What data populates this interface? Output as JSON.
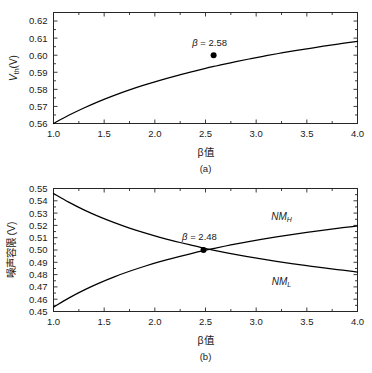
{
  "figure": {
    "background": "#ffffff",
    "line_color": "#000000",
    "axis_color": "#262626"
  },
  "panels": [
    {
      "id": "a",
      "subcaption": "(a)",
      "xlabel": "β值",
      "ylabel_main": "V",
      "ylabel_sub": "th",
      "ylabel_unit": "(V)",
      "ylabel_full": "V th (V)",
      "annotation": "β = 2.58",
      "annotation_beta": "2.58",
      "xticks": [
        "1.0",
        "1.5",
        "2.0",
        "2.5",
        "3.0",
        "3.5",
        "4.0"
      ],
      "yticks": [
        "0.56",
        "0.57",
        "0.58",
        "0.59",
        "0.60",
        "0.61",
        "0.62"
      ]
    },
    {
      "id": "b",
      "subcaption": "(b)",
      "xlabel": "β值",
      "ylabel_full": "噪声容限 (V)",
      "annotation": "β = 2.48",
      "annotation_beta": "2.48",
      "series_high_main": "NM",
      "series_high_sub": "H",
      "series_low_main": "NM",
      "series_low_sub": "L",
      "xticks": [
        "1.0",
        "1.5",
        "2.0",
        "2.5",
        "3.0",
        "3.5",
        "4.0"
      ],
      "yticks": [
        "0.45",
        "0.46",
        "0.47",
        "0.48",
        "0.49",
        "0.50",
        "0.51",
        "0.52",
        "0.53",
        "0.54",
        "0.55"
      ]
    }
  ],
  "chart_data": [
    {
      "type": "line",
      "panel": "a",
      "title": "",
      "xlabel": "β值",
      "ylabel": "V_th(V)",
      "xlim": [
        1.0,
        4.0
      ],
      "ylim": [
        0.56,
        0.625
      ],
      "xticks": [
        1.0,
        1.5,
        2.0,
        2.5,
        3.0,
        3.5,
        4.0
      ],
      "yticks": [
        0.56,
        0.57,
        0.58,
        0.59,
        0.6,
        0.61,
        0.62
      ],
      "grid": false,
      "legend": "none",
      "series": [
        {
          "name": "V_th",
          "x": [
            1.0,
            1.15,
            1.3,
            1.45,
            1.6,
            1.75,
            1.9,
            2.05,
            2.2,
            2.35,
            2.5,
            2.58,
            2.65,
            2.8,
            2.95,
            3.1,
            3.25,
            3.4,
            3.55,
            3.7,
            3.85,
            4.0
          ],
          "values": [
            0.56,
            0.5648,
            0.5691,
            0.573,
            0.5765,
            0.5797,
            0.5826,
            0.5853,
            0.5878,
            0.5901,
            0.5923,
            0.5934,
            0.5943,
            0.5962,
            0.598,
            0.5997,
            0.6013,
            0.6028,
            0.6042,
            0.6056,
            0.6069,
            0.6081
          ]
        }
      ],
      "annotations": [
        {
          "text": "β = 2.58",
          "x": 2.58,
          "y": 0.6,
          "marker": true,
          "marker_x": 2.58,
          "marker_y": 0.6
        }
      ]
    },
    {
      "type": "line",
      "panel": "b",
      "title": "",
      "xlabel": "β值",
      "ylabel": "噪声容限 (V)",
      "xlim": [
        1.0,
        4.0
      ],
      "ylim": [
        0.45,
        0.55
      ],
      "xticks": [
        1.0,
        1.5,
        2.0,
        2.5,
        3.0,
        3.5,
        4.0
      ],
      "yticks": [
        0.45,
        0.46,
        0.47,
        0.48,
        0.49,
        0.5,
        0.51,
        0.52,
        0.53,
        0.54,
        0.55
      ],
      "grid": false,
      "legend": "inline-labels",
      "series": [
        {
          "name": "NM_H",
          "x": [
            1.0,
            1.15,
            1.3,
            1.45,
            1.6,
            1.75,
            1.9,
            2.05,
            2.2,
            2.35,
            2.48,
            2.6,
            2.75,
            2.9,
            3.05,
            3.2,
            3.35,
            3.5,
            3.65,
            3.8,
            3.95,
            4.0
          ],
          "values": [
            0.4535,
            0.4609,
            0.4674,
            0.4731,
            0.4782,
            0.4827,
            0.4868,
            0.4905,
            0.4938,
            0.4969,
            0.4995,
            0.5016,
            0.5041,
            0.5064,
            0.5086,
            0.5106,
            0.5125,
            0.5143,
            0.516,
            0.5176,
            0.5191,
            0.5196
          ]
        },
        {
          "name": "NM_L",
          "x": [
            1.0,
            1.15,
            1.3,
            1.45,
            1.6,
            1.75,
            1.9,
            2.05,
            2.2,
            2.35,
            2.48,
            2.6,
            2.75,
            2.9,
            3.05,
            3.2,
            3.35,
            3.5,
            3.65,
            3.8,
            3.95,
            4.0
          ],
          "values": [
            0.546,
            0.5389,
            0.5326,
            0.5271,
            0.5222,
            0.5178,
            0.5139,
            0.5103,
            0.5071,
            0.5041,
            0.5016,
            0.4995,
            0.4971,
            0.4949,
            0.4928,
            0.4908,
            0.489,
            0.4873,
            0.4856,
            0.4841,
            0.4826,
            0.4821
          ]
        }
      ],
      "annotations": [
        {
          "text": "β = 2.48",
          "x": 2.48,
          "y": 0.5016,
          "marker": true,
          "marker_x": 2.48,
          "marker_y": 0.5
        },
        {
          "text": "NM_H",
          "x": 3.25,
          "y": 0.5195
        },
        {
          "text": "NM_L",
          "x": 3.25,
          "y": 0.4815
        }
      ]
    }
  ]
}
